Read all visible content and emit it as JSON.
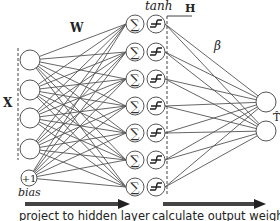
{
  "diagram": {
    "labels": {
      "weights_in": "W",
      "inputs": "X",
      "activation": "tanh",
      "hidden": "H",
      "weights_out": "β",
      "output": "T̂",
      "bias_node": "+1",
      "bias": "bias"
    },
    "input_nodes": 4,
    "hidden_nodes": 7,
    "output_nodes": 2,
    "steps": [
      {
        "label": "project to hidden layer"
      },
      {
        "label": "calculate output weights"
      }
    ],
    "colors": {
      "line": "#555555",
      "arrow": "#444444",
      "text": "#222222"
    }
  }
}
